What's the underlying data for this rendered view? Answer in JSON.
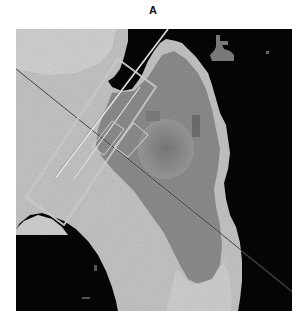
{
  "figure": {
    "panel_label": "A",
    "colors": {
      "background": "#ffffff",
      "void": "#050505",
      "light_gray": "#c8c8c8",
      "mid_gray": "#8e8e8e",
      "dark_gray": "#6e6e6e",
      "overlay_line_light": "#e6e6e6",
      "overlay_line_dark": "#3a3a3a"
    },
    "overlays": [
      {
        "type": "line",
        "name": "diagonal-transect",
        "from": [
          0,
          40
        ],
        "to": [
          276,
          265
        ]
      },
      {
        "type": "rectangle",
        "name": "long-rotated-box"
      },
      {
        "type": "rectangle",
        "name": "small-center-box"
      }
    ]
  }
}
